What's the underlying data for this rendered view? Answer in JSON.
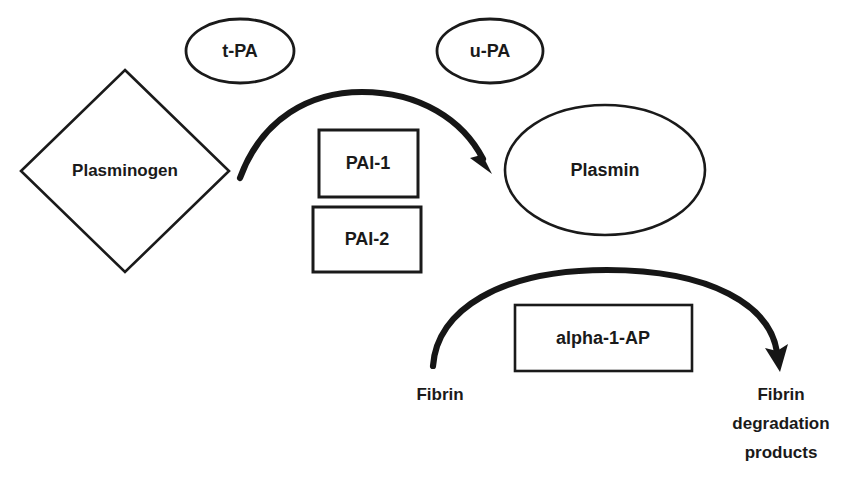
{
  "canvas": {
    "width": 867,
    "height": 492,
    "background": "#ffffff",
    "ink": "#1a1a1a"
  },
  "diagram": {
    "type": "flow-diagram",
    "topic": "Fibrinolysis pathway",
    "nodes": {
      "plasminogen": {
        "label": "Plasminogen",
        "shape": "diamond",
        "cx": 125,
        "cy": 171,
        "rx": 104,
        "ry": 101,
        "font_size": 17
      },
      "tpa": {
        "label": "t-PA",
        "shape": "ellipse",
        "cx": 240,
        "cy": 51,
        "rx": 54,
        "ry": 32,
        "font_size": 18
      },
      "upa": {
        "label": "u-PA",
        "shape": "ellipse",
        "cx": 490,
        "cy": 51,
        "rx": 53,
        "ry": 32,
        "font_size": 18
      },
      "plasmin": {
        "label": "Plasmin",
        "shape": "ellipse",
        "cx": 605,
        "cy": 170,
        "rx": 100,
        "ry": 65,
        "font_size": 18
      },
      "pai1": {
        "label": "PAI-1",
        "shape": "rect",
        "x": 319,
        "y": 130,
        "width": 99,
        "height": 67,
        "font_size": 18
      },
      "pai2": {
        "label": "PAI-2",
        "shape": "rect",
        "x": 313,
        "y": 207,
        "width": 108,
        "height": 65,
        "font_size": 18
      },
      "alpha1ap": {
        "label": "alpha-1-AP",
        "shape": "rect",
        "x": 515,
        "y": 305,
        "width": 177,
        "height": 66,
        "font_size": 18
      },
      "fibrin": {
        "label": "Fibrin",
        "shape": "text",
        "cx": 440,
        "cy": 395,
        "font_size": 17
      },
      "fibrin_degradation_products": {
        "lines": [
          "Fibrin",
          "degradation",
          "products"
        ],
        "shape": "text-multiline",
        "cx": 781,
        "cy": 395,
        "line_height": 29,
        "font_size": 17
      }
    },
    "arrows": [
      {
        "name": "plasminogen-to-plasmin",
        "from": "plasminogen",
        "to": "plasmin",
        "style": "curved-arc",
        "stroke_width": 6
      },
      {
        "name": "fibrin-to-degradation-products",
        "from": "fibrin",
        "to": "fibrin_degradation_products",
        "style": "curved-arc",
        "stroke_width": 6
      }
    ]
  }
}
